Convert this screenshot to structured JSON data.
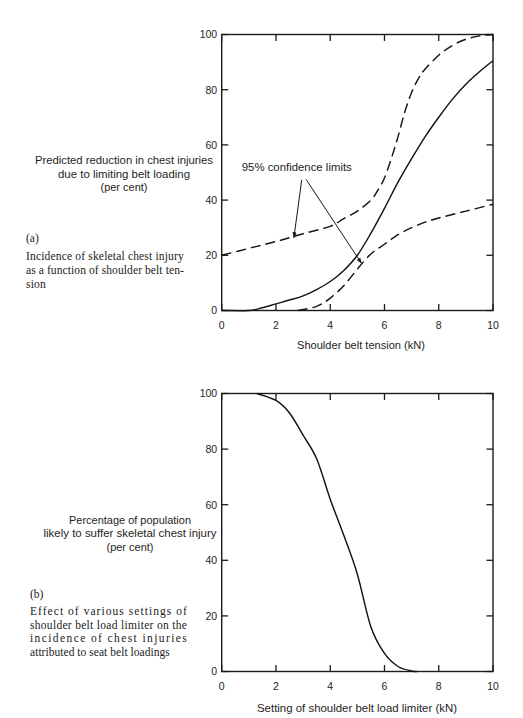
{
  "chart_data": [
    {
      "panel": "(a)",
      "type": "line",
      "title": "Incidence of skeletal chest injury as a function of shoulder belt tension",
      "caption_lines": [
        "Incidence of skeletal chest injury",
        "as a function of shoulder belt ten-",
        "sion"
      ],
      "xlabel": "Shoulder belt tension (kN)",
      "ylabel": "Predicted reduction in chest injuries due to limiting belt loading (per cent)",
      "ylabel_lines": [
        "Predicted reduction in chest injuries",
        "due to limiting belt loading",
        "(per cent)"
      ],
      "xlim": [
        0,
        10
      ],
      "ylim": [
        0,
        100
      ],
      "xticks": [
        0,
        2,
        4,
        6,
        8,
        10
      ],
      "yticks": [
        0,
        20,
        40,
        60,
        80,
        100
      ],
      "grid": false,
      "legend": null,
      "series": [
        {
          "id": "predicted-reduction",
          "name": "Predicted reduction in chest injuries",
          "style": "solid",
          "x": [
            0,
            1,
            1.5,
            2,
            2.5,
            3,
            3.5,
            4,
            4.5,
            5,
            5.5,
            6,
            6.5,
            7,
            7.5,
            8,
            8.5,
            9,
            9.5,
            10
          ],
          "y": [
            0,
            0,
            1.0,
            2.4,
            3.8,
            5.3,
            7.6,
            10.5,
            14.5,
            20,
            28,
            37,
            46.5,
            55,
            63,
            70,
            76.5,
            82,
            86.5,
            90.5
          ]
        },
        {
          "id": "upper-confidence-limit",
          "name": "95% confidence limit (upper)",
          "style": "dashed",
          "x": [
            0,
            1,
            2,
            3,
            4,
            4.5,
            5,
            5.5,
            5.75,
            6,
            6.25,
            6.5,
            6.75,
            7,
            7.25,
            7.5,
            8,
            8.5,
            9,
            9.5,
            10
          ],
          "y": [
            20,
            22.5,
            25,
            27.8,
            30.5,
            33.3,
            36,
            40,
            43.5,
            48,
            55,
            63,
            72,
            79,
            84,
            87.5,
            92.5,
            96,
            98.3,
            99.5,
            100
          ]
        },
        {
          "id": "lower-confidence-limit",
          "name": "95% confidence limit (lower)",
          "style": "dashed",
          "x": [
            2.8,
            3.5,
            4,
            4.5,
            5,
            5.5,
            6,
            6.5,
            7,
            7.5,
            8,
            9,
            10
          ],
          "y": [
            0,
            1.5,
            4.5,
            9,
            15,
            20.5,
            24,
            27.5,
            30,
            32,
            33.5,
            36,
            38.5
          ]
        }
      ],
      "annotations": [
        {
          "text": "95% confidence limits",
          "text_pos": [
            0.74,
            50.5
          ],
          "arrows": [
            {
              "from": [
                2.95,
                47.3
              ],
              "to": [
                2.66,
                26.3
              ]
            },
            {
              "from": [
                3.11,
                47.5
              ],
              "to": [
                5.16,
                17.0
              ]
            }
          ]
        }
      ]
    },
    {
      "panel": "(b)",
      "type": "line",
      "title": "Effect of various settings of shoulder belt load limiter on the incidence of chest injuries attributed to seat belt loadings",
      "caption_lines": [
        "Effect of various settings of",
        "shoulder belt load limiter on the",
        "incidence of chest injuries",
        "attributed to seat belt loadings"
      ],
      "xlabel": "Setting of shoulder belt load limiter (kN)",
      "ylabel": "Percentage of population likely to suffer skeletal chest injury (per cent)",
      "ylabel_lines": [
        "Percentage of population",
        "likely to suffer skeletal chest injury",
        "(per cent)"
      ],
      "xlim": [
        0,
        10
      ],
      "ylim": [
        0,
        100
      ],
      "xticks": [
        0,
        2,
        4,
        6,
        8,
        10
      ],
      "yticks": [
        0,
        20,
        40,
        60,
        80,
        100
      ],
      "grid": false,
      "legend": null,
      "series": [
        {
          "id": "population-injury",
          "name": "Percentage of population likely to suffer skeletal chest injury",
          "style": "solid",
          "x": [
            1.3,
            2,
            2.5,
            3,
            3.5,
            4,
            4.5,
            5,
            5.5,
            6,
            6.5,
            7,
            7.2
          ],
          "y": [
            100,
            97.5,
            93,
            85,
            76.5,
            62,
            49,
            35,
            16,
            6.5,
            1.8,
            0.2,
            0
          ]
        }
      ],
      "annotations": []
    }
  ]
}
